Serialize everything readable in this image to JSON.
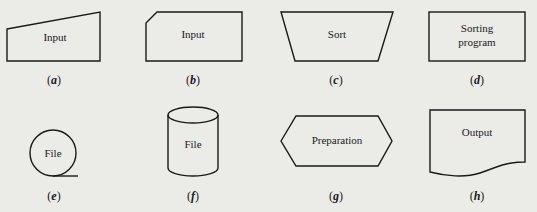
{
  "figure": {
    "shapes": [
      {
        "id": "a",
        "type": "manual-input",
        "label": "Input",
        "caption": "a"
      },
      {
        "id": "b",
        "type": "punched-card",
        "label": "Input",
        "caption": "b"
      },
      {
        "id": "c",
        "type": "manual-operation",
        "label": "Sort",
        "caption": "c"
      },
      {
        "id": "d",
        "type": "process",
        "label_lines": [
          "Sorting",
          "program"
        ],
        "caption": "d"
      },
      {
        "id": "e",
        "type": "magnetic-tape",
        "label": "File",
        "caption": "e"
      },
      {
        "id": "f",
        "type": "magnetic-disk",
        "label": "File",
        "caption": "f"
      },
      {
        "id": "g",
        "type": "preparation",
        "label": "Preparation",
        "caption": "g"
      },
      {
        "id": "h",
        "type": "document",
        "label": "Output",
        "caption": "h"
      }
    ]
  }
}
